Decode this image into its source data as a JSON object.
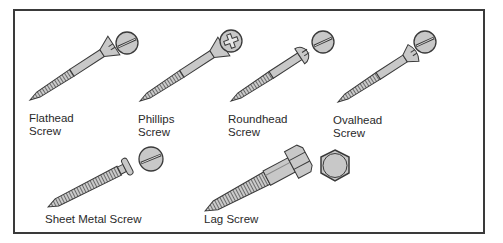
{
  "figure": {
    "type": "screw-types-illustration",
    "colors": {
      "outline": "#3a3a3a",
      "fill": "#c8c8c8",
      "thread": "#8a8a8a",
      "background": "#ffffff"
    }
  },
  "screws": [
    {
      "id": "flathead",
      "line1": "Flathead",
      "line2": "Screw",
      "head_view": "slotted"
    },
    {
      "id": "phillips",
      "line1": "Phillips",
      "line2": "Screw",
      "head_view": "cross"
    },
    {
      "id": "roundhead",
      "line1": "Roundhead",
      "line2": "Screw",
      "head_view": "slotted"
    },
    {
      "id": "ovalhead",
      "line1": "Ovalhead",
      "line2": "Screw",
      "head_view": "slotted"
    },
    {
      "id": "sheet-metal",
      "line1": "Sheet Metal Screw",
      "head_view": "slotted"
    },
    {
      "id": "lag",
      "line1": "Lag Screw",
      "head_view": "hexagon"
    }
  ]
}
